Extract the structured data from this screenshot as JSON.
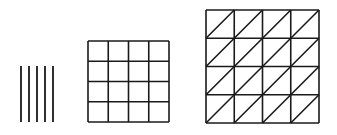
{
  "colors": {
    "stroke": "#1a1a1a",
    "background": "#ffffff"
  },
  "figures": [
    {
      "name": "parallel-lines",
      "count": 5,
      "x0": 21,
      "spacing": 8,
      "y_top": 66,
      "y_bottom": 122
    },
    {
      "name": "square-grid",
      "rows": 4,
      "cols": 4,
      "x": 88,
      "y": 41,
      "size": 81,
      "diagonals": false
    },
    {
      "name": "triangulated-grid",
      "rows": 4,
      "cols": 4,
      "x": 206,
      "y": 10,
      "size": 113,
      "diagonals": true
    }
  ]
}
